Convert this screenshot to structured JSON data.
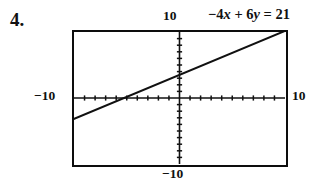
{
  "problem": {
    "number": "4."
  },
  "equation": {
    "lhs_term1": "−4",
    "lhs_var1": "x",
    "operator": "+",
    "lhs_term2": "6",
    "lhs_var2": "y",
    "equals": "=",
    "rhs": "21",
    "full_text": "−4x + 6y = 21"
  },
  "axis_labels": {
    "top": "10",
    "left": "−10",
    "right": "10",
    "bottom": "−10"
  },
  "chart_data": {
    "type": "line",
    "title": "−4x + 6y = 21",
    "xlabel": "",
    "ylabel": "",
    "xlim": [
      -10,
      10
    ],
    "ylim": [
      -10,
      10
    ],
    "grid": false,
    "legend": false,
    "axis_tick_interval": 1,
    "x_axis_tick_labels": [
      "−10",
      "10"
    ],
    "y_axis_tick_labels": [
      "−10",
      "10"
    ],
    "series": [
      {
        "name": "−4x + 6y = 21",
        "equation": "-4x + 6y = 21",
        "slope": 0.6667,
        "y_intercept": 3.5,
        "x_intercept": -5.25,
        "x": [
          -10,
          10
        ],
        "y": [
          -3.1667,
          10.1667
        ],
        "color": "#111111",
        "style": "solid"
      }
    ],
    "annotations": [
      {
        "text": "10",
        "position": "top-of-y-axis"
      },
      {
        "text": "−10",
        "position": "left-of-x-axis"
      },
      {
        "text": "10",
        "position": "right-of-x-axis"
      },
      {
        "text": "−10",
        "position": "bottom-of-y-axis"
      }
    ]
  }
}
